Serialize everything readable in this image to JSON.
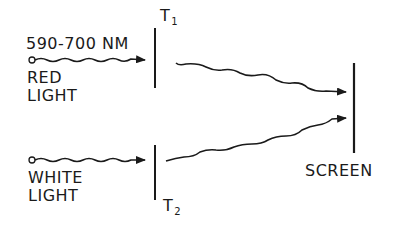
{
  "diagram": {
    "labels": {
      "wavelength": "590-700 NM",
      "red_line1": "RED",
      "red_line2": "LIGHT",
      "white_line1": "WHITE",
      "white_line2": "LIGHT",
      "t1_main": "T",
      "t1_sub": "1",
      "t2_main": "T",
      "t2_sub": "2",
      "screen": "SCREEN"
    },
    "colors": {
      "ink": "#1a1a1a",
      "background": "#ffffff"
    }
  }
}
